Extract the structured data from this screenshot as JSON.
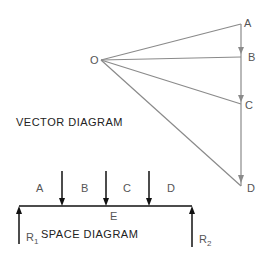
{
  "vector_diagram": {
    "title": "VECTOR DIAGRAM",
    "pole_label": "O",
    "points": [
      {
        "label": "A"
      },
      {
        "label": "B"
      },
      {
        "label": "C"
      },
      {
        "label": "D"
      }
    ],
    "line_color": "#8a8a8a"
  },
  "space_diagram": {
    "title": "SPACE DIAGRAM",
    "space_labels": [
      "A",
      "B",
      "C",
      "D"
    ],
    "below_label": "E",
    "reactions": [
      {
        "label": "R",
        "sub": "1"
      },
      {
        "label": "R",
        "sub": "2"
      }
    ],
    "line_color": "#111111"
  }
}
